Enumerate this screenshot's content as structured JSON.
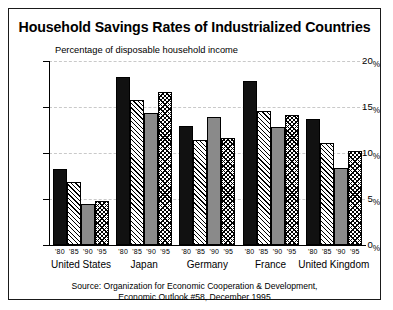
{
  "chart_data": {
    "type": "bar",
    "title": "Household Savings Rates of Industrialized Countries",
    "subtitle": "Percentage of disposable household income",
    "xlabel": "",
    "ylabel": "",
    "ylim": [
      0,
      20
    ],
    "yticks": [
      0,
      5,
      10,
      15,
      20
    ],
    "ytick_labels": [
      "0%",
      "5%",
      "10%",
      "15%",
      "20%"
    ],
    "grid": true,
    "legend": "none",
    "categories": [
      "United States",
      "Japan",
      "Germany",
      "France",
      "United Kingdom"
    ],
    "series": [
      {
        "name": "'80",
        "pattern": "solid-black",
        "values": [
          8.3,
          18.3,
          12.9,
          17.8,
          13.7
        ]
      },
      {
        "name": "'85",
        "pattern": "diagonal-hatch",
        "values": [
          6.9,
          15.8,
          11.4,
          14.6,
          11.1
        ]
      },
      {
        "name": "'90",
        "pattern": "solid-gray",
        "values": [
          4.5,
          14.4,
          13.9,
          12.8,
          8.4
        ]
      },
      {
        "name": "'95",
        "pattern": "crosshatch",
        "values": [
          4.8,
          16.6,
          11.6,
          14.1,
          10.2
        ]
      }
    ],
    "tick_labels_per_group": [
      "'80",
      "'85",
      "'90",
      "'95"
    ],
    "source_line1": "Source: Organization for Economic Cooperation & Development,",
    "source_line2": "Economic Outlook #58, December 1995",
    "colors": {
      "bar_black": "#111111",
      "bar_gray": "#8a8a8a",
      "bar_white": "#ffffff",
      "axis": "#000000",
      "grid": "#c9c9c9",
      "background": "#ffffff",
      "border": "#1a1a1a"
    }
  },
  "yticks_display": [
    {
      "num": "20",
      "pct": "%"
    },
    {
      "num": "15",
      "pct": "%"
    },
    {
      "num": "10",
      "pct": "%"
    },
    {
      "num": "5",
      "pct": "%"
    },
    {
      "num": "0",
      "pct": "%"
    }
  ]
}
